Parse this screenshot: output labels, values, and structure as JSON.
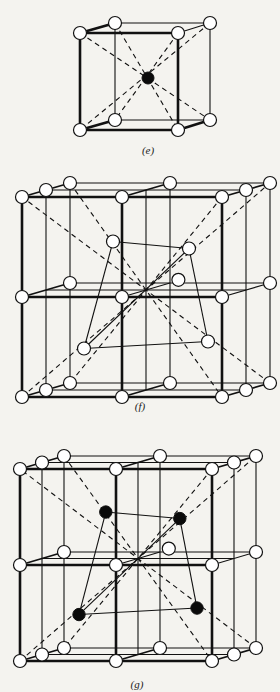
{
  "figure": {
    "panels": [
      {
        "id": "e",
        "caption": "(e)",
        "description": "Body-centered cubic unit cell: 8 corner atoms (open) with 1 body-center atom (solid), body diagonals dashed"
      },
      {
        "id": "f",
        "caption": "(f)",
        "description": "2x2x2 arrangement of cubes (face-centered cubic cell) with open atoms at corners and face centers; tetrahedron of open atoms drawn inside, body diagonals dashed"
      },
      {
        "id": "g",
        "caption": "(g)",
        "description": "Same face-centered cubic arrangement with 4 tetrahedral-site atoms (solid) connected as a tetrahedron, body diagonals dashed"
      }
    ],
    "legend": {
      "open_circle": "atom",
      "solid_circle": "interstitial / center atom"
    }
  }
}
